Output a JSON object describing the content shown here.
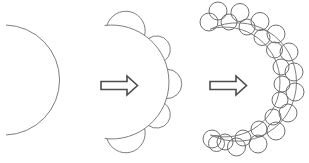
{
  "canvas": {
    "width": 309,
    "height": 163,
    "background": "#ffffff"
  },
  "style": {
    "shape_stroke": "#7e7e7e",
    "bubble_stroke": "#6f6f6f",
    "arrow_stroke": "#4c4c4c",
    "arrow_fill": "#ffffff",
    "shape_stroke_width": 1,
    "bubble_stroke_width": 1,
    "arrow_stroke_width": 1.6
  },
  "stage1": {
    "arc": {
      "cx": 4.5,
      "cy": 80,
      "r": 55,
      "a1": -88,
      "a2": 88
    }
  },
  "arrow1": {
    "points": [
      [
        101,
        81.5
      ],
      [
        127,
        81.5
      ],
      [
        127,
        76
      ],
      [
        137.5,
        85.5
      ],
      [
        127,
        95
      ],
      [
        127,
        89.5
      ],
      [
        101,
        89.5
      ]
    ]
  },
  "stage2": {
    "arc": {
      "cx": 112,
      "cy": 82,
      "r": 57,
      "a1": -97,
      "a2": 97
    },
    "bumps": [
      {
        "a1": -95,
        "a2": -55
      },
      {
        "a1": -50,
        "a2": -22
      },
      {
        "a1": -13,
        "a2": 17
      },
      {
        "a1": 22,
        "a2": 50
      },
      {
        "a1": 55,
        "a2": 95
      }
    ]
  },
  "arrow2": {
    "points": [
      [
        210,
        81.5
      ],
      [
        236,
        81.5
      ],
      [
        236,
        76
      ],
      [
        246.5,
        85.5
      ],
      [
        236,
        95
      ],
      [
        236,
        89.5
      ],
      [
        210,
        89.5
      ]
    ]
  },
  "stage3": {
    "inner_arc": {
      "cx": 225,
      "cy": 82,
      "r": 55,
      "a1": -105,
      "a2": 105
    },
    "outer_arc": {
      "x1": 210.8,
      "y1": 28.9,
      "x2": 210.8,
      "y2": 135.1,
      "r": 59.3,
      "large": 1,
      "sweep": 1
    },
    "circles": [
      [
        209,
        22,
        9
      ],
      [
        218,
        11,
        9
      ],
      [
        229,
        22,
        8
      ],
      [
        240,
        12.5,
        9
      ],
      [
        247,
        27,
        8
      ],
      [
        260,
        21.5,
        9
      ],
      [
        262,
        37.5,
        8
      ],
      [
        276,
        34,
        9
      ],
      [
        274.5,
        50,
        8
      ],
      [
        289,
        52,
        9
      ],
      [
        281,
        67,
        8
      ],
      [
        294,
        72,
        9
      ],
      [
        282,
        84,
        8
      ],
      [
        295,
        92,
        9
      ],
      [
        280,
        100,
        8
      ],
      [
        288,
        113,
        9
      ],
      [
        273,
        117,
        8
      ],
      [
        276,
        131,
        9
      ],
      [
        259,
        129,
        8
      ],
      [
        258,
        144,
        9
      ],
      [
        243,
        138,
        8
      ],
      [
        236.5,
        147,
        9
      ],
      [
        225,
        142,
        8
      ],
      [
        216.5,
        143.5,
        8
      ],
      [
        212,
        139,
        9
      ]
    ]
  }
}
